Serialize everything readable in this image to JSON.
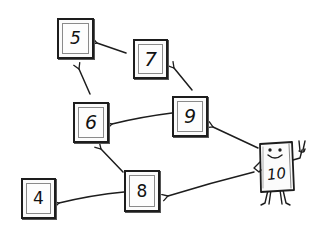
{
  "diagram": {
    "type": "hand-drawn node graph",
    "nodes": [
      {
        "id": "5",
        "label": "5",
        "x": 57,
        "y": 18,
        "w": 37,
        "h": 41
      },
      {
        "id": "7",
        "label": "7",
        "x": 133,
        "y": 39,
        "w": 35,
        "h": 40
      },
      {
        "id": "6",
        "label": "6",
        "x": 73,
        "y": 102,
        "w": 36,
        "h": 41
      },
      {
        "id": "9",
        "label": "9",
        "x": 172,
        "y": 96,
        "w": 36,
        "h": 41
      },
      {
        "id": "8",
        "label": "8",
        "x": 124,
        "y": 170,
        "w": 36,
        "h": 42
      },
      {
        "id": "4",
        "label": "4",
        "x": 21,
        "y": 178,
        "w": 35,
        "h": 41
      }
    ],
    "character": {
      "id": "10",
      "label": "10",
      "description": "smiling box character making a peace sign"
    },
    "edges": [
      {
        "from": "7",
        "to": "5"
      },
      {
        "from": "6",
        "to": "5"
      },
      {
        "from": "9",
        "to": "7"
      },
      {
        "from": "9",
        "to": "6"
      },
      {
        "from": "8",
        "to": "6"
      },
      {
        "from": "8",
        "to": "4"
      },
      {
        "from": "10",
        "to": "9"
      },
      {
        "from": "10",
        "to": "8"
      }
    ],
    "colors": {
      "stroke": "#1d1d1d",
      "background": "#ffffff"
    }
  }
}
